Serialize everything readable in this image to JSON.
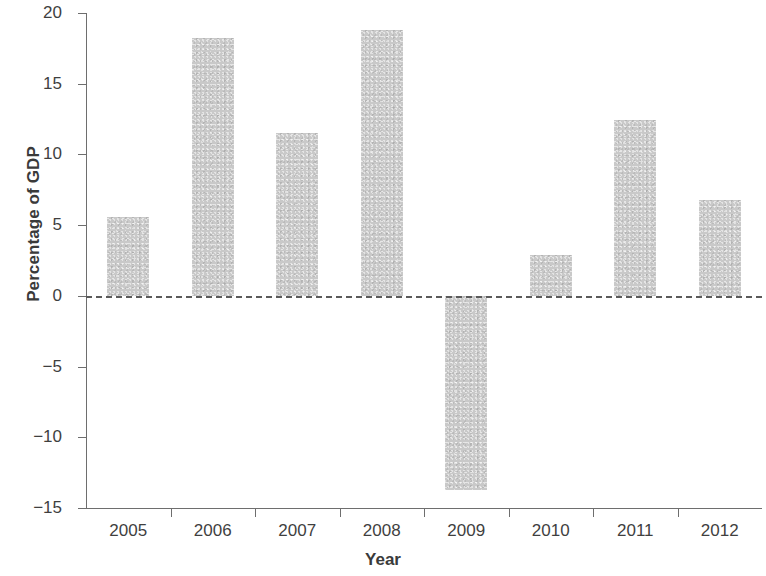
{
  "chart_data": {
    "type": "bar",
    "title": "",
    "xlabel": "Year",
    "ylabel": "Percentage of GDP",
    "categories": [
      "2005",
      "2006",
      "2007",
      "2008",
      "2009",
      "2010",
      "2011",
      "2012"
    ],
    "values": [
      5.6,
      18.2,
      11.5,
      18.8,
      -13.7,
      2.9,
      12.4,
      6.8
    ],
    "ylim": [
      -15,
      20
    ],
    "yticks": [
      20,
      15,
      10,
      5,
      0,
      -5,
      -10,
      -15
    ],
    "ytick_labels": [
      "20",
      "15",
      "10",
      "5",
      "0",
      "−5",
      "−10",
      "−15"
    ],
    "grid": false,
    "legend": null,
    "bar_color": "#c9c9c9",
    "axis_color": "#6e6e6e",
    "zero_line": {
      "value": 0,
      "style": "dashed",
      "color": "#5a5a5a"
    }
  }
}
